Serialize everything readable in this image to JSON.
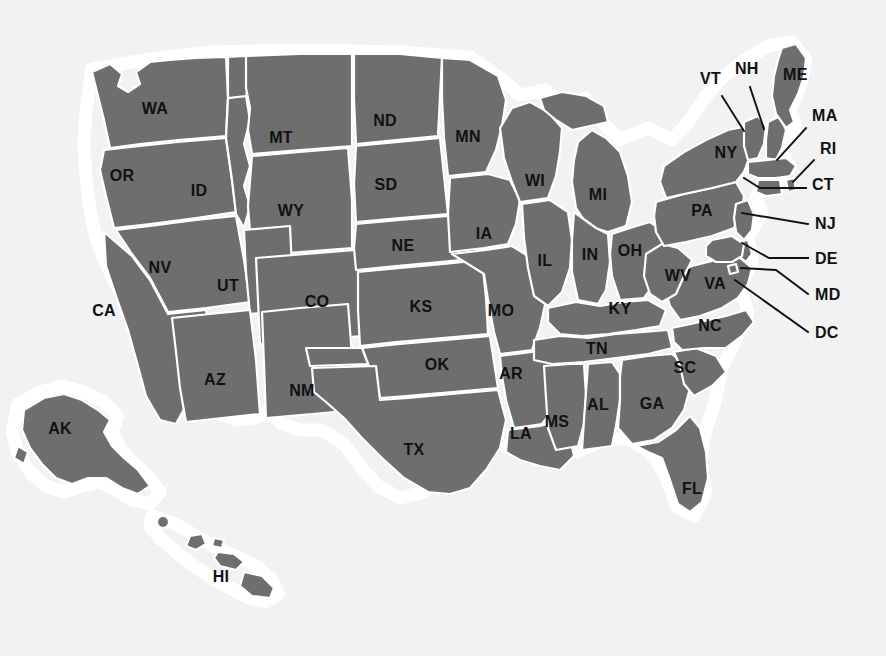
{
  "map": {
    "title": "United States state abbreviations map",
    "colors": {
      "background": "#f2f2f2",
      "state_fill": "#6e6e6e",
      "state_border": "#ffffff",
      "halo": "#ffffff",
      "label_text": "#111111",
      "leader_line": "#111111"
    },
    "inline_labels": [
      {
        "code": "WA",
        "x": 155,
        "y": 110
      },
      {
        "code": "OR",
        "x": 122,
        "y": 177
      },
      {
        "code": "ID",
        "x": 199,
        "y": 192
      },
      {
        "code": "MT",
        "x": 281,
        "y": 139
      },
      {
        "code": "ND",
        "x": 385,
        "y": 122
      },
      {
        "code": "SD",
        "x": 386,
        "y": 186
      },
      {
        "code": "MN",
        "x": 468,
        "y": 138
      },
      {
        "code": "WI",
        "x": 535,
        "y": 182
      },
      {
        "code": "MI",
        "x": 598,
        "y": 196
      },
      {
        "code": "WY",
        "x": 291,
        "y": 212
      },
      {
        "code": "NE",
        "x": 403,
        "y": 247
      },
      {
        "code": "IA",
        "x": 484,
        "y": 235
      },
      {
        "code": "IL",
        "x": 545,
        "y": 262
      },
      {
        "code": "IN",
        "x": 590,
        "y": 256
      },
      {
        "code": "OH",
        "x": 630,
        "y": 252
      },
      {
        "code": "NV",
        "x": 160,
        "y": 269
      },
      {
        "code": "UT",
        "x": 228,
        "y": 287
      },
      {
        "code": "CO",
        "x": 317,
        "y": 303
      },
      {
        "code": "KS",
        "x": 421,
        "y": 308
      },
      {
        "code": "MO",
        "x": 501,
        "y": 312
      },
      {
        "code": "KY",
        "x": 620,
        "y": 310
      },
      {
        "code": "WV",
        "x": 678,
        "y": 277
      },
      {
        "code": "VA",
        "x": 715,
        "y": 285
      },
      {
        "code": "NC",
        "x": 710,
        "y": 327
      },
      {
        "code": "CA",
        "x": 104,
        "y": 312
      },
      {
        "code": "AZ",
        "x": 215,
        "y": 381
      },
      {
        "code": "NM",
        "x": 302,
        "y": 392
      },
      {
        "code": "OK",
        "x": 437,
        "y": 366
      },
      {
        "code": "AR",
        "x": 511,
        "y": 375
      },
      {
        "code": "TN",
        "x": 597,
        "y": 350
      },
      {
        "code": "SC",
        "x": 685,
        "y": 369
      },
      {
        "code": "TX",
        "x": 414,
        "y": 451
      },
      {
        "code": "LA",
        "x": 521,
        "y": 435
      },
      {
        "code": "MS",
        "x": 557,
        "y": 423
      },
      {
        "code": "AL",
        "x": 598,
        "y": 406
      },
      {
        "code": "GA",
        "x": 652,
        "y": 405
      },
      {
        "code": "FL",
        "x": 692,
        "y": 490
      },
      {
        "code": "PA",
        "x": 702,
        "y": 212
      },
      {
        "code": "NY",
        "x": 726,
        "y": 154
      },
      {
        "code": "AK",
        "x": 60,
        "y": 430
      },
      {
        "code": "HI",
        "x": 221,
        "y": 578
      }
    ],
    "callouts": [
      {
        "code": "VT",
        "label_x": 700,
        "label_y": 80,
        "points": "722,96 744,131"
      },
      {
        "code": "NH",
        "label_x": 735,
        "label_y": 70,
        "points": "750,87 764,129"
      },
      {
        "code": "ME",
        "label_x": 783,
        "label_y": 76,
        "points": ""
      },
      {
        "code": "MA",
        "label_x": 812,
        "label_y": 117,
        "points": "806,128 777,160"
      },
      {
        "code": "RI",
        "label_x": 820,
        "label_y": 150,
        "points": "814,160 793,182"
      },
      {
        "code": "CT",
        "label_x": 812,
        "label_y": 186,
        "points": "806,188 760,188 744,178"
      },
      {
        "code": "NJ",
        "label_x": 815,
        "label_y": 225,
        "points": "808,224 742,213"
      },
      {
        "code": "DE",
        "label_x": 815,
        "label_y": 260,
        "points": "808,258 769,258 742,243"
      },
      {
        "code": "MD",
        "label_x": 815,
        "label_y": 296,
        "points": "808,294 776,270 741,268"
      },
      {
        "code": "DC",
        "label_x": 815,
        "label_y": 334,
        "points": "808,332 735,280"
      }
    ]
  }
}
